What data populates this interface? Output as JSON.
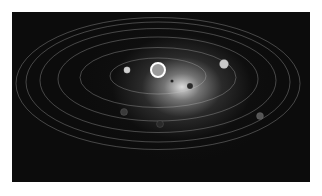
{
  "image": {
    "subject": "Solar system illustration",
    "style": "grayscale",
    "background_color": "#0c0c0c",
    "border_color": "#ffffff"
  },
  "scene": {
    "sun": {
      "cx": 158,
      "cy": 70,
      "r": 7
    },
    "orbits": [
      {
        "rx": 48,
        "ry": 18
      },
      {
        "rx": 78,
        "ry": 30
      },
      {
        "rx": 100,
        "ry": 42
      },
      {
        "rx": 118,
        "ry": 52
      },
      {
        "rx": 132,
        "ry": 60
      },
      {
        "rx": 142,
        "ry": 66
      }
    ],
    "planets": [
      {
        "name": "planet-left-inner",
        "cx": 127,
        "cy": 70,
        "r": 3.2,
        "fill": "#d0d0d0"
      },
      {
        "name": "planet-small-right",
        "cx": 172,
        "cy": 81,
        "r": 1.6,
        "fill": "#222222"
      },
      {
        "name": "planet-dark-right",
        "cx": 190,
        "cy": 86,
        "r": 3,
        "fill": "#2a2a2a"
      },
      {
        "name": "planet-bright-upper-right",
        "cx": 224,
        "cy": 64,
        "r": 4.5,
        "fill": "#c8c8c8"
      },
      {
        "name": "planet-lower-left",
        "cx": 124,
        "cy": 112,
        "r": 3.5,
        "fill": "#3a3a3a"
      },
      {
        "name": "planet-lower-mid",
        "cx": 160,
        "cy": 124,
        "r": 3.5,
        "fill": "#2a2a2a"
      },
      {
        "name": "planet-lower-right",
        "cx": 260,
        "cy": 116,
        "r": 3.5,
        "fill": "#555555"
      }
    ]
  }
}
